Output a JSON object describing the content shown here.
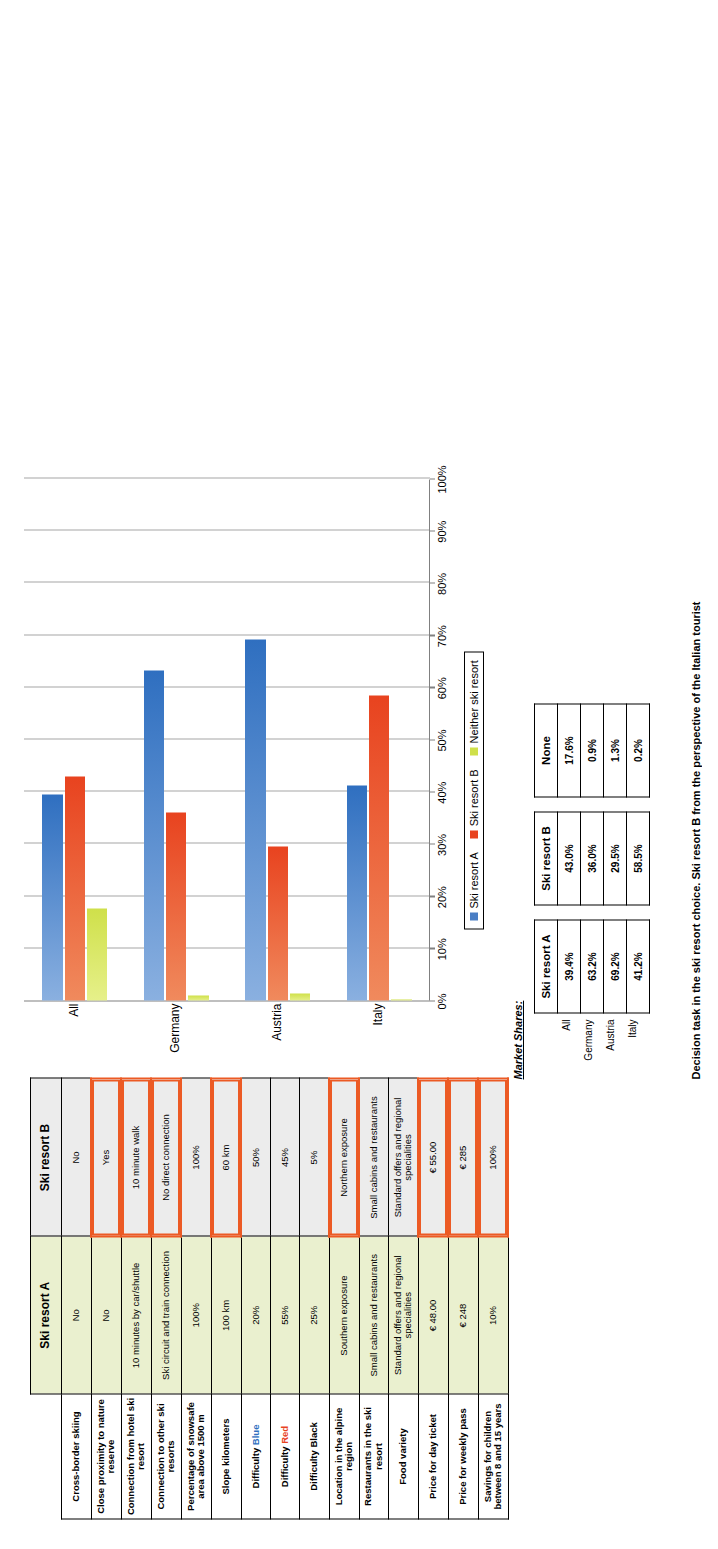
{
  "comparison_table": {
    "headers": [
      "",
      "Ski resort A",
      "Ski resort B"
    ],
    "rows": [
      {
        "feature": "Cross-border skiing",
        "a": "No",
        "b": "No",
        "b_highlight": false
      },
      {
        "feature": "Close proximity to nature reserve",
        "a": "No",
        "b": "Yes",
        "b_highlight": true
      },
      {
        "feature": "Connection from hotel ski resort",
        "a": "10 minutes by car/shuttle",
        "b": "10 minute walk",
        "b_highlight": true
      },
      {
        "feature": "Connection to other ski resorts",
        "a": "Ski circuit and train connection",
        "b": "No direct connection",
        "b_highlight": true
      },
      {
        "feature": "Percentage of snowsafe area above 1500 m",
        "a": "100%",
        "b": "100%",
        "b_highlight": false
      },
      {
        "feature": "Slope kilometers",
        "a": "100 km",
        "b": "60 km",
        "b_highlight": true
      },
      {
        "feature": "Difficulty Blue",
        "feature_value_color": "#2f6fc0",
        "a": "20%",
        "b": "50%",
        "b_highlight": false
      },
      {
        "feature": "Difficulty Red",
        "feature_value_color": "#e8431f",
        "a": "55%",
        "b": "45%",
        "b_highlight": false
      },
      {
        "feature": "Difficulty Black",
        "feature_value_color": "#000000",
        "a": "25%",
        "b": "5%",
        "b_highlight": false
      },
      {
        "feature": "Location in the alpine region",
        "a": "Southern exposure",
        "b": "Northern exposure",
        "b_highlight": true
      },
      {
        "feature": "Restaurants in the ski resort",
        "a": "Small cabins and restaurants",
        "b": "Small cabins and restaurants",
        "b_highlight": false
      },
      {
        "feature": "Food variety",
        "a": "Standard offers and regional specialities",
        "b": "Standard offers and regional specialities",
        "b_highlight": false
      },
      {
        "feature": "Price for day ticket",
        "a": "€ 48.00",
        "b": "€ 55.00",
        "b_highlight": true
      },
      {
        "feature": "Price for weekly pass",
        "a": "€ 248",
        "b": "€ 285",
        "b_highlight": true
      },
      {
        "feature": "Savings for children between 8 and 15 years",
        "a": "10%",
        "b": "100%",
        "b_highlight": true
      }
    ]
  },
  "chart_data": {
    "type": "bar",
    "title": "",
    "xlabel": "",
    "ylabel": "",
    "orientation": "vertical",
    "categories": [
      "All",
      "Germany",
      "Austria",
      "Italy"
    ],
    "series": [
      {
        "name": "Ski resort A",
        "color": "#4a7ec4",
        "values": [
          39.4,
          63.2,
          69.2,
          41.2
        ]
      },
      {
        "name": "Ski resort B",
        "color": "#e8431f",
        "values": [
          43.0,
          36.0,
          29.5,
          58.5
        ]
      },
      {
        "name": "Neither ski resort",
        "color": "#cfe04a",
        "values": [
          17.6,
          0.9,
          1.3,
          0.2
        ]
      }
    ],
    "ylim": [
      0,
      100
    ],
    "ytick_labels": [
      "0%",
      "10%",
      "20%",
      "30%",
      "40%",
      "50%",
      "60%",
      "70%",
      "80%",
      "90%",
      "100%"
    ],
    "ytick_values": [
      0,
      10,
      20,
      30,
      40,
      50,
      60,
      70,
      80,
      90,
      100
    ],
    "grid": true,
    "legend_position": "bottom",
    "legend": [
      "Ski resort A",
      "Ski resort B",
      "Neither ski resort"
    ]
  },
  "market_shares": {
    "title": "Market Shares:",
    "row_labels": [
      "All",
      "Germany",
      "Austria",
      "Italy"
    ],
    "tables": [
      {
        "header": "Ski resort A",
        "values": [
          "39.4%",
          "63.2%",
          "69.2%",
          "41.2%"
        ]
      },
      {
        "header": "Ski resort B",
        "values": [
          "43.0%",
          "36.0%",
          "29.5%",
          "58.5%"
        ]
      },
      {
        "header": "None",
        "values": [
          "17.6%",
          "0.9%",
          "1.3%",
          "0.2%"
        ]
      }
    ]
  },
  "caption": "Decision task in the ski resort choice. Ski resort B from the perspective of the Italian tourist",
  "colors": {
    "ski_a": "#4a7ec4",
    "ski_b": "#e8431f",
    "neither": "#cfe04a",
    "highlight_border": "#ec5a24",
    "col_a_bg": "#eaf0cf",
    "col_b_bg": "#ececec"
  }
}
